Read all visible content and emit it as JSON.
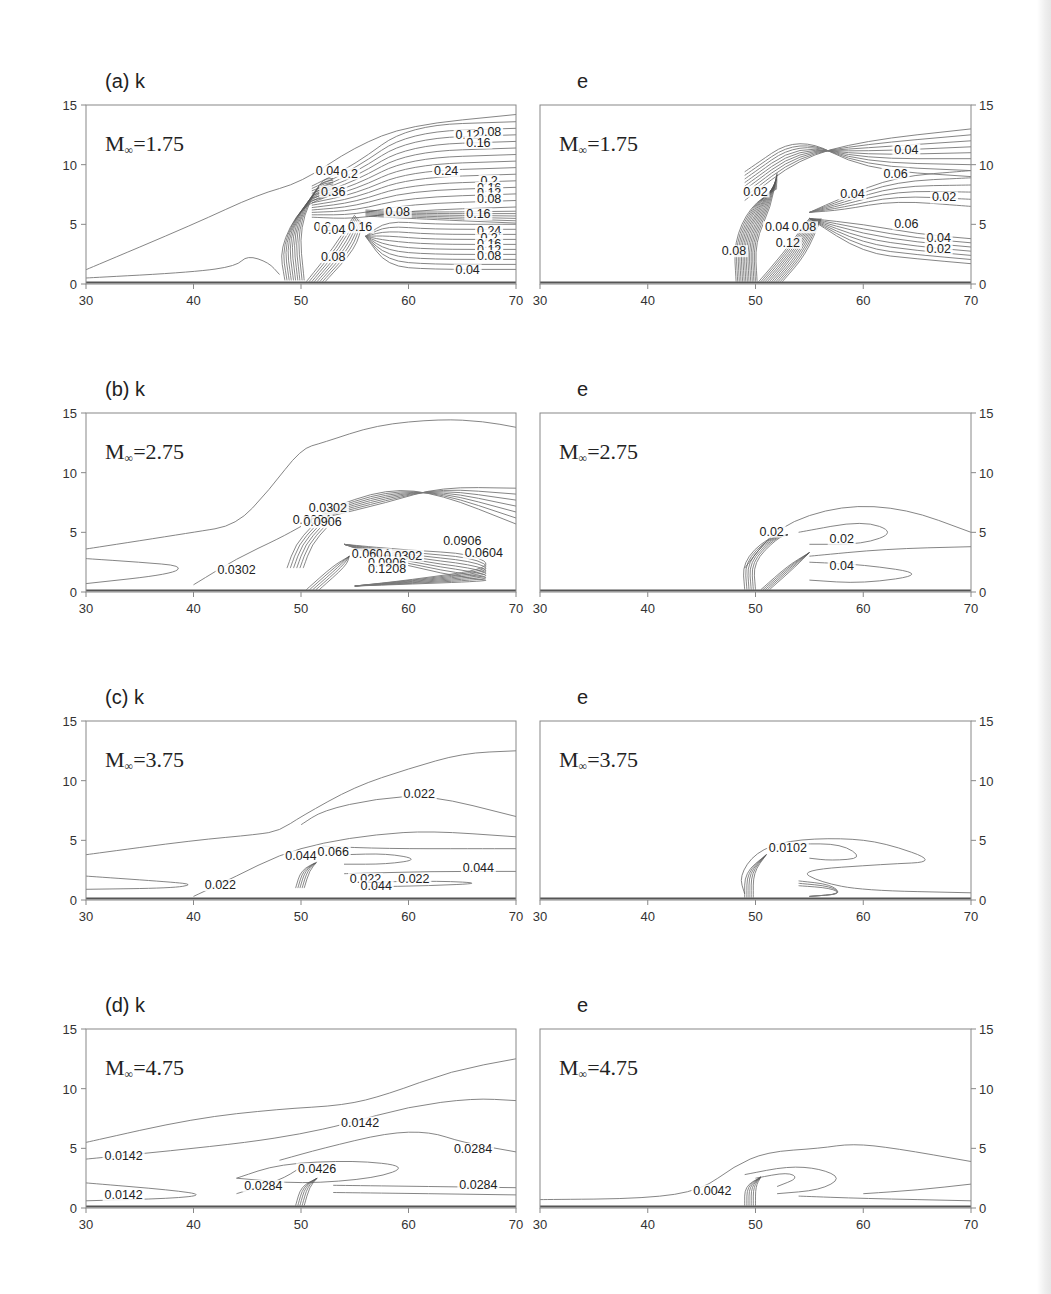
{
  "figure": {
    "rows": [
      {
        "id": "a",
        "k_title": "(a) k",
        "e_title": "e",
        "mach_label": "M",
        "mach_sub": "∞",
        "mach_value": "=1.75"
      },
      {
        "id": "b",
        "k_title": "(b) k",
        "e_title": "e",
        "mach_label": "M",
        "mach_sub": "∞",
        "mach_value": "=2.75"
      },
      {
        "id": "c",
        "k_title": "(c) k",
        "e_title": "e",
        "mach_label": "M",
        "mach_sub": "∞",
        "mach_value": "=3.75"
      },
      {
        "id": "d",
        "k_title": "(d) k",
        "e_title": "e",
        "mach_label": "M",
        "mach_sub": "∞",
        "mach_value": "=4.75"
      }
    ],
    "x_ticks": [
      "30",
      "40",
      "50",
      "60",
      "70"
    ],
    "y_ticks": [
      "0",
      "5",
      "10",
      "15"
    ]
  },
  "chart_data": [
    {
      "type": "contour",
      "panel": "(a) k",
      "title": "(a) k",
      "annotation": "M∞=1.75",
      "xlim": [
        30,
        70
      ],
      "ylim": [
        0,
        15
      ],
      "x_ticks": [
        30,
        40,
        50,
        60,
        70
      ],
      "y_ticks": [
        0,
        5,
        10,
        15
      ],
      "y_axis_side": "left",
      "contour_labels": [
        {
          "text": "0.08",
          "x": 67.5,
          "y": 12.5
        },
        {
          "text": "0.12",
          "x": 65.5,
          "y": 12.2
        },
        {
          "text": "0.16",
          "x": 66.5,
          "y": 11.6
        },
        {
          "text": "0.24",
          "x": 63.5,
          "y": 9.2
        },
        {
          "text": "0.2",
          "x": 67.5,
          "y": 8.4
        },
        {
          "text": "0.16",
          "x": 67.5,
          "y": 7.8
        },
        {
          "text": "0.12",
          "x": 67.5,
          "y": 7.4
        },
        {
          "text": "0.08",
          "x": 67.5,
          "y": 6.9
        },
        {
          "text": "0.08",
          "x": 59,
          "y": 5.8
        },
        {
          "text": "0.16",
          "x": 66.5,
          "y": 5.6
        },
        {
          "text": "0.24",
          "x": 67.5,
          "y": 4.2
        },
        {
          "text": "0.2",
          "x": 67.5,
          "y": 3.6
        },
        {
          "text": "0.16",
          "x": 67.5,
          "y": 3.1
        },
        {
          "text": "0.12",
          "x": 67.5,
          "y": 2.6
        },
        {
          "text": "0.08",
          "x": 67.5,
          "y": 2.1
        },
        {
          "text": "0.04",
          "x": 65.5,
          "y": 0.9
        },
        {
          "text": "0.04",
          "x": 52.5,
          "y": 9.2
        },
        {
          "text": "0.2",
          "x": 54.5,
          "y": 9.0
        },
        {
          "text": "0.36",
          "x": 53,
          "y": 7.5
        },
        {
          "text": "0.2",
          "x": 52,
          "y": 4.5
        },
        {
          "text": "0.04",
          "x": 53,
          "y": 4.3
        },
        {
          "text": "0.16",
          "x": 55.5,
          "y": 4.5
        },
        {
          "text": "0.08",
          "x": 53,
          "y": 2.0
        }
      ]
    },
    {
      "type": "contour",
      "panel": "e (a)",
      "title": "e",
      "annotation": "M∞=1.75",
      "xlim": [
        30,
        70
      ],
      "ylim": [
        0,
        15
      ],
      "x_ticks": [
        30,
        40,
        50,
        60,
        70
      ],
      "y_ticks": [
        0,
        5,
        10,
        15
      ],
      "y_axis_side": "right",
      "contour_labels": [
        {
          "text": "0.04",
          "x": 64,
          "y": 11.0
        },
        {
          "text": "0.06",
          "x": 63,
          "y": 9.0
        },
        {
          "text": "0.04",
          "x": 59,
          "y": 7.3
        },
        {
          "text": "0.02",
          "x": 67.5,
          "y": 7.0
        },
        {
          "text": "0.06",
          "x": 64,
          "y": 4.8
        },
        {
          "text": "0.04",
          "x": 67,
          "y": 3.6
        },
        {
          "text": "0.02",
          "x": 67,
          "y": 2.7
        },
        {
          "text": "0.02",
          "x": 50,
          "y": 7.5
        },
        {
          "text": "0.04",
          "x": 52,
          "y": 4.5
        },
        {
          "text": "0.12",
          "x": 53,
          "y": 3.2
        },
        {
          "text": "0.08",
          "x": 54.5,
          "y": 4.5
        },
        {
          "text": "0.08",
          "x": 48,
          "y": 2.5
        }
      ]
    },
    {
      "type": "contour",
      "panel": "(b) k",
      "title": "(b) k",
      "annotation": "M∞=2.75",
      "xlim": [
        30,
        70
      ],
      "ylim": [
        0,
        15
      ],
      "x_ticks": [
        30,
        40,
        50,
        60,
        70
      ],
      "y_ticks": [
        0,
        5,
        10,
        15
      ],
      "y_axis_side": "left",
      "contour_labels": [
        {
          "text": "0.0302",
          "x": 52.5,
          "y": 6.8
        },
        {
          "text": "0.0604",
          "x": 51,
          "y": 5.8
        },
        {
          "text": "0.0906",
          "x": 52,
          "y": 5.6
        },
        {
          "text": "0.0906",
          "x": 65,
          "y": 4.0
        },
        {
          "text": "0.0604",
          "x": 67,
          "y": 3.0
        },
        {
          "text": "0.0302",
          "x": 44,
          "y": 1.6
        },
        {
          "text": "0.0604",
          "x": 56.5,
          "y": 2.9
        },
        {
          "text": "0.0302",
          "x": 59.5,
          "y": 2.8
        },
        {
          "text": "0.0906",
          "x": 58,
          "y": 2.2
        },
        {
          "text": "0.1208",
          "x": 58,
          "y": 1.7
        }
      ]
    },
    {
      "type": "contour",
      "panel": "e (b)",
      "title": "e",
      "annotation": "M∞=2.75",
      "xlim": [
        30,
        70
      ],
      "ylim": [
        0,
        15
      ],
      "x_ticks": [
        30,
        40,
        50,
        60,
        70
      ],
      "y_ticks": [
        0,
        5,
        10,
        15
      ],
      "y_axis_side": "right",
      "contour_labels": [
        {
          "text": "0.02",
          "x": 51.5,
          "y": 4.8
        },
        {
          "text": "0.02",
          "x": 58,
          "y": 4.2
        },
        {
          "text": "0.04",
          "x": 58,
          "y": 1.9
        }
      ]
    },
    {
      "type": "contour",
      "panel": "(c) k",
      "title": "(c) k",
      "annotation": "M∞=3.75",
      "xlim": [
        30,
        70
      ],
      "ylim": [
        0,
        15
      ],
      "x_ticks": [
        30,
        40,
        50,
        60,
        70
      ],
      "y_ticks": [
        0,
        5,
        10,
        15
      ],
      "y_axis_side": "left",
      "contour_labels": [
        {
          "text": "0.022",
          "x": 61,
          "y": 8.6
        },
        {
          "text": "0.044",
          "x": 50,
          "y": 3.4
        },
        {
          "text": "0.066",
          "x": 53,
          "y": 3.8
        },
        {
          "text": "0.022",
          "x": 42.5,
          "y": 1.0
        },
        {
          "text": "0.022",
          "x": 56,
          "y": 1.5
        },
        {
          "text": "0.022",
          "x": 60.5,
          "y": 1.5
        },
        {
          "text": "0.044",
          "x": 57,
          "y": 0.9
        },
        {
          "text": "0.044",
          "x": 66.5,
          "y": 2.4
        }
      ]
    },
    {
      "type": "contour",
      "panel": "e (c)",
      "title": "e",
      "annotation": "M∞=3.75",
      "xlim": [
        30,
        70
      ],
      "ylim": [
        0,
        15
      ],
      "x_ticks": [
        30,
        40,
        50,
        60,
        70
      ],
      "y_ticks": [
        0,
        5,
        10,
        15
      ],
      "y_axis_side": "right",
      "contour_labels": [
        {
          "text": "0.0102",
          "x": 53,
          "y": 4.1
        }
      ]
    },
    {
      "type": "contour",
      "panel": "(d) k",
      "title": "(d) k",
      "annotation": "M∞=4.75",
      "xlim": [
        30,
        70
      ],
      "ylim": [
        0,
        15
      ],
      "x_ticks": [
        30,
        40,
        50,
        60,
        70
      ],
      "y_ticks": [
        0,
        5,
        10,
        15
      ],
      "y_axis_side": "left",
      "contour_labels": [
        {
          "text": "0.0142",
          "x": 33.5,
          "y": 4.1
        },
        {
          "text": "0.0142",
          "x": 55.5,
          "y": 6.9
        },
        {
          "text": "0.0284",
          "x": 66,
          "y": 4.7
        },
        {
          "text": "0.0284",
          "x": 46.5,
          "y": 1.6
        },
        {
          "text": "0.0426",
          "x": 51.5,
          "y": 3.0
        },
        {
          "text": "0.0284",
          "x": 66.5,
          "y": 1.7
        },
        {
          "text": "0.0142",
          "x": 33.5,
          "y": 0.8
        }
      ]
    },
    {
      "type": "contour",
      "panel": "e (d)",
      "title": "e",
      "annotation": "M∞=4.75",
      "xlim": [
        30,
        70
      ],
      "ylim": [
        0,
        15
      ],
      "x_ticks": [
        30,
        40,
        50,
        60,
        70
      ],
      "y_ticks": [
        0,
        5,
        10,
        15
      ],
      "y_axis_side": "right",
      "contour_labels": [
        {
          "text": "0.0042",
          "x": 46,
          "y": 1.2
        }
      ]
    }
  ]
}
